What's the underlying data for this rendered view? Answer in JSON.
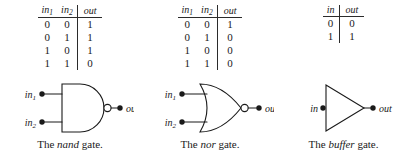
{
  "figure": {
    "background": "#ffffff",
    "ink": "#1a1a1a"
  },
  "panels": [
    {
      "id": "nand",
      "gate_name": "nand",
      "caption_prefix": "The ",
      "caption_name": "nand",
      "caption_suffix": " gate.",
      "symbol": {
        "shape": "and-body-with-bubble",
        "inverting_bubble": true,
        "input_labels": [
          "in",
          "in"
        ],
        "input_subscripts": [
          "1",
          "2"
        ],
        "output_label": "out"
      },
      "table": {
        "headers": [
          "in",
          "in",
          "out"
        ],
        "header_subscripts": [
          "1",
          "2",
          ""
        ],
        "rows": [
          [
            "0",
            "0",
            "1"
          ],
          [
            "0",
            "1",
            "1"
          ],
          [
            "1",
            "0",
            "1"
          ],
          [
            "1",
            "1",
            "0"
          ]
        ]
      }
    },
    {
      "id": "nor",
      "gate_name": "nor",
      "caption_prefix": "The ",
      "caption_name": "nor",
      "caption_suffix": " gate.",
      "symbol": {
        "shape": "or-body-with-bubble",
        "inverting_bubble": true,
        "input_labels": [
          "in",
          "in"
        ],
        "input_subscripts": [
          "1",
          "2"
        ],
        "output_label": "out"
      },
      "table": {
        "headers": [
          "in",
          "in",
          "out"
        ],
        "header_subscripts": [
          "1",
          "2",
          ""
        ],
        "rows": [
          [
            "0",
            "0",
            "1"
          ],
          [
            "0",
            "1",
            "0"
          ],
          [
            "1",
            "0",
            "0"
          ],
          [
            "1",
            "1",
            "0"
          ]
        ]
      }
    },
    {
      "id": "buffer",
      "gate_name": "buffer",
      "caption_prefix": "The ",
      "caption_name": "buffer",
      "caption_suffix": " gate.",
      "symbol": {
        "shape": "triangle",
        "inverting_bubble": false,
        "input_labels": [
          "in"
        ],
        "input_subscripts": [
          ""
        ],
        "output_label": "out"
      },
      "table": {
        "headers": [
          "in",
          "out"
        ],
        "header_subscripts": [
          "",
          ""
        ],
        "rows": [
          [
            "0",
            "0"
          ],
          [
            "1",
            "1"
          ]
        ]
      }
    }
  ]
}
